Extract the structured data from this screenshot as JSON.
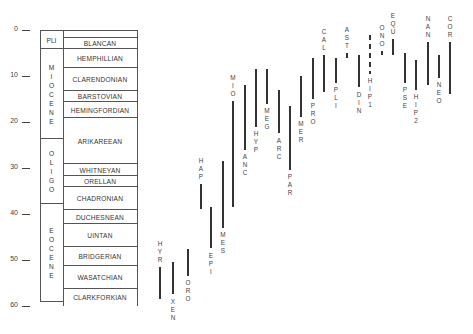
{
  "chart_data": {
    "type": "range-bar",
    "title": "",
    "ylabel": "Ma",
    "ylim": [
      0,
      60
    ],
    "y_ticks": [
      0,
      10,
      20,
      30,
      40,
      50,
      60
    ],
    "epochs": [
      {
        "label": "PLI",
        "start": 0,
        "end": 4
      },
      {
        "label": "MIOCENE",
        "start": 4,
        "end": 23.5
      },
      {
        "label": "OLIGO",
        "start": 23.5,
        "end": 37.5
      },
      {
        "label": "EOCENE",
        "start": 37.5,
        "end": 59
      }
    ],
    "stages": [
      {
        "label": "BLANCAN",
        "start": 1.5,
        "end": 4
      },
      {
        "label": "HEMPHILLIAN",
        "start": 4,
        "end": 8
      },
      {
        "label": "CLARENDONIAN",
        "start": 8,
        "end": 13
      },
      {
        "label": "BARSTOVIAN",
        "start": 13,
        "end": 15.5
      },
      {
        "label": "HEMINGFORDIAN",
        "start": 15.5,
        "end": 19
      },
      {
        "label": "ARIKAREEAN",
        "start": 19,
        "end": 29
      },
      {
        "label": "WHITNEYAN",
        "start": 29,
        "end": 31.5
      },
      {
        "label": "ORELLAN",
        "start": 31.5,
        "end": 34
      },
      {
        "label": "CHADRONIAN",
        "start": 34,
        "end": 39
      },
      {
        "label": "DUCHESNEAN",
        "start": 39,
        "end": 42
      },
      {
        "label": "UINTAN",
        "start": 42,
        "end": 47
      },
      {
        "label": "BRIDGERIAN",
        "start": 47,
        "end": 51
      },
      {
        "label": "WASATCHIAN",
        "start": 51,
        "end": 56
      },
      {
        "label": "CLARKFORKIAN",
        "start": 56,
        "end": 60
      }
    ],
    "taxa": [
      {
        "label": "HYR",
        "x": 159,
        "start": 51.5,
        "end": 58.5,
        "label_pos": "above"
      },
      {
        "label": "XEN",
        "x": 172,
        "start": 50.5,
        "end": 57.5,
        "label_pos": "below"
      },
      {
        "label": "ORO",
        "x": 187,
        "start": 47.5,
        "end": 53.5,
        "label_pos": "below"
      },
      {
        "label": "HAP",
        "x": 200,
        "start": 33.5,
        "end": 39,
        "label_pos": "above"
      },
      {
        "label": "EPI",
        "x": 210,
        "start": 38.5,
        "end": 47.5,
        "label_pos": "below"
      },
      {
        "label": "MES",
        "x": 222,
        "start": 28.5,
        "end": 43,
        "label_pos": "below"
      },
      {
        "label": "MIO",
        "x": 232,
        "start": 15.5,
        "end": 38.5,
        "label_pos": "above"
      },
      {
        "label": "ANC",
        "x": 244,
        "start": 12,
        "end": 26,
        "label_pos": "below"
      },
      {
        "label": "HYP",
        "x": 255,
        "start": 8.5,
        "end": 21,
        "label_pos": "below"
      },
      {
        "label": "MEG",
        "x": 266,
        "start": 8.5,
        "end": 16,
        "label_pos": "below"
      },
      {
        "label": "ARC",
        "x": 278,
        "start": 13,
        "end": 22.5,
        "label_pos": "below"
      },
      {
        "label": "PAR",
        "x": 289,
        "start": 16.5,
        "end": 30.5,
        "label_pos": "below"
      },
      {
        "label": "MER",
        "x": 300,
        "start": 10,
        "end": 19,
        "label_pos": "below"
      },
      {
        "label": "PRO",
        "x": 312,
        "start": 6,
        "end": 15,
        "label_pos": "below"
      },
      {
        "label": "CAL",
        "x": 323,
        "start": 5.5,
        "end": 13.5,
        "label_pos": "above"
      },
      {
        "label": "PLI",
        "x": 335,
        "start": 6,
        "end": 11.5,
        "label_pos": "below"
      },
      {
        "label": "AST",
        "x": 346,
        "start": 5,
        "end": 6,
        "label_pos": "above"
      },
      {
        "label": "DIN",
        "x": 358,
        "start": 5.5,
        "end": 12.5,
        "label_pos": "below"
      },
      {
        "label": "HIP1",
        "x": 369,
        "start": 1,
        "end": 9.5,
        "label_pos": "below",
        "dashed": true
      },
      {
        "label": "ONO",
        "x": 381,
        "start": 4.5,
        "end": 5.5,
        "label_pos": "above"
      },
      {
        "label": "EQU",
        "x": 392,
        "start": 2,
        "end": 5.5,
        "label_pos": "above"
      },
      {
        "label": "PSE",
        "x": 404,
        "start": 5,
        "end": 11.5,
        "label_pos": "below"
      },
      {
        "label": "HIP2",
        "x": 415,
        "start": 6.5,
        "end": 13,
        "label_pos": "below"
      },
      {
        "label": "NAN",
        "x": 427,
        "start": 2.5,
        "end": 12,
        "label_pos": "above"
      },
      {
        "label": "NEO",
        "x": 438,
        "start": 5.5,
        "end": 10.5,
        "label_pos": "below"
      },
      {
        "label": "COR",
        "x": 449,
        "start": 2.5,
        "end": 14,
        "label_pos": "above"
      }
    ]
  }
}
